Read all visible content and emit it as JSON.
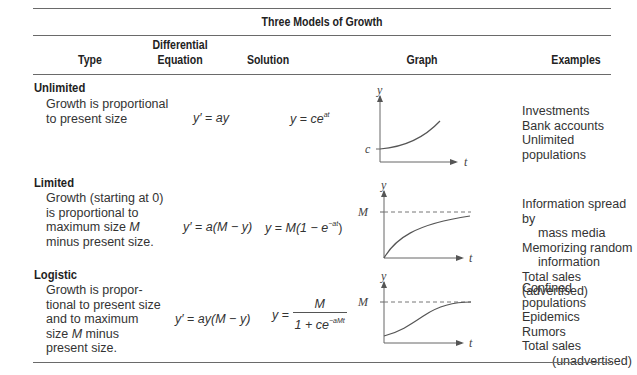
{
  "table": {
    "title": "Three Models of Growth",
    "headers": {
      "type": "Type",
      "differential_equation_line1": "Differential",
      "differential_equation_line2": "Equation",
      "solution": "Solution",
      "graph": "Graph",
      "examples": "Examples"
    },
    "rows": [
      {
        "type": "Unlimited",
        "description": "Growth is proportional\nto present size",
        "equation_lhs": "y′",
        "equation_rhs": "ay",
        "solution_lhs": "y",
        "solution_base": "ce",
        "solution_exp": "at",
        "graph": {
          "y_axis_label": "y",
          "x_axis_label": "t",
          "intercept_label": "c",
          "curve": "exponential"
        },
        "examples": [
          "Investments",
          "Bank accounts",
          "Unlimited populations"
        ]
      },
      {
        "type": "Limited",
        "description_lines": [
          "Growth (starting at 0)",
          "is proportional to",
          "maximum size ",
          "minus present size."
        ],
        "description_var": "M",
        "equation_lhs": "y′",
        "equation_rhs_prefix": "a(",
        "equation_rhs_M": "M",
        "equation_rhs_suffix": " − y)",
        "solution_lhs": "y",
        "solution_text": "M(1 − e",
        "solution_exp": "−at",
        "solution_close": ")",
        "graph": {
          "y_axis_label": "y",
          "x_axis_label": "t",
          "asymptote_label": "M",
          "curve": "bounded-growth"
        },
        "examples": [
          "Information spread by",
          "mass media",
          "Memorizing random",
          "information",
          "Total sales (advertised)"
        ]
      },
      {
        "type": "Logistic",
        "description_lines": [
          "Growth is propor-",
          "tional to present size",
          "and to maximum",
          "size ",
          "present size."
        ],
        "description_var": "M",
        "description_after_var": " minus",
        "equation_lhs": "y′",
        "equation_rhs": "ay(M − y)",
        "solution_lhs": "y",
        "solution_numerator": "M",
        "solution_denominator_prefix": "1 + ce",
        "solution_denominator_exp": "−aMt",
        "graph": {
          "y_axis_label": "y",
          "x_axis_label": "t",
          "asymptote_label": "M",
          "curve": "logistic"
        },
        "examples": [
          "Confined populations",
          "Epidemics",
          "Rumors",
          "Total sales",
          "(unadvertised)"
        ]
      }
    ]
  }
}
